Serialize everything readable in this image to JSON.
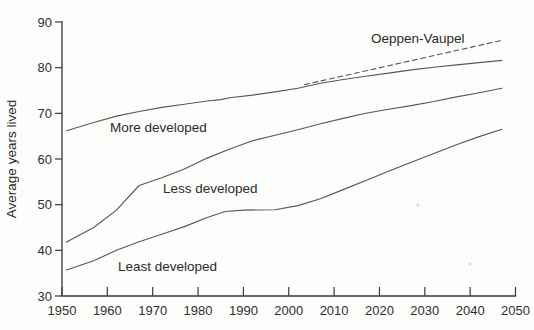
{
  "figure": {
    "kind": "scanned-book-line-chart",
    "background_color": "#fdfdfc",
    "line_color": "#585858",
    "axis_color": "#3a3a3a",
    "text_color": "#2b2b2b"
  },
  "chart_data": {
    "type": "line",
    "title": "",
    "xlabel": "",
    "ylabel": "Average years lived",
    "xlim": [
      1950,
      2050
    ],
    "ylim": [
      30,
      90
    ],
    "x_ticks": [
      1950,
      1960,
      1970,
      1980,
      1990,
      2000,
      2010,
      2020,
      2030,
      2040,
      2050
    ],
    "y_ticks": [
      30,
      40,
      50,
      60,
      70,
      80,
      90
    ],
    "grid": false,
    "legend_position": "inline-annotations",
    "series": [
      {
        "name": "More developed",
        "style": "solid",
        "points": [
          [
            1951,
            66.2
          ],
          [
            1957,
            68.0
          ],
          [
            1962,
            69.4
          ],
          [
            1967,
            70.4
          ],
          [
            1972,
            71.3
          ],
          [
            1977,
            72.0
          ],
          [
            1982,
            72.7
          ],
          [
            1985,
            73.0
          ],
          [
            1987,
            73.4
          ],
          [
            1992,
            74.0
          ],
          [
            1997,
            74.7
          ],
          [
            2002,
            75.5
          ],
          [
            2007,
            76.6
          ],
          [
            2012,
            77.4
          ],
          [
            2017,
            78.1
          ],
          [
            2022,
            78.8
          ],
          [
            2027,
            79.5
          ],
          [
            2032,
            80.1
          ],
          [
            2037,
            80.6
          ],
          [
            2042,
            81.1
          ],
          [
            2047,
            81.6
          ]
        ]
      },
      {
        "name": "Less developed",
        "style": "solid",
        "points": [
          [
            1951,
            41.8
          ],
          [
            1957,
            45.0
          ],
          [
            1962,
            48.8
          ],
          [
            1967,
            54.2
          ],
          [
            1972,
            55.9
          ],
          [
            1977,
            57.8
          ],
          [
            1982,
            60.2
          ],
          [
            1987,
            62.2
          ],
          [
            1992,
            64.0
          ],
          [
            1997,
            65.2
          ],
          [
            2002,
            66.4
          ],
          [
            2007,
            67.7
          ],
          [
            2012,
            68.9
          ],
          [
            2017,
            70.0
          ],
          [
            2022,
            70.9
          ],
          [
            2027,
            71.7
          ],
          [
            2032,
            72.6
          ],
          [
            2037,
            73.6
          ],
          [
            2042,
            74.5
          ],
          [
            2047,
            75.5
          ]
        ]
      },
      {
        "name": "Least developed",
        "style": "solid",
        "points": [
          [
            1951,
            35.7
          ],
          [
            1957,
            37.7
          ],
          [
            1962,
            40.0
          ],
          [
            1967,
            41.9
          ],
          [
            1972,
            43.5
          ],
          [
            1977,
            45.2
          ],
          [
            1982,
            47.2
          ],
          [
            1986,
            48.5
          ],
          [
            1990,
            48.8
          ],
          [
            1997,
            48.9
          ],
          [
            2002,
            49.8
          ],
          [
            2007,
            51.3
          ],
          [
            2012,
            53.3
          ],
          [
            2017,
            55.3
          ],
          [
            2022,
            57.3
          ],
          [
            2027,
            59.3
          ],
          [
            2032,
            61.2
          ],
          [
            2037,
            63.1
          ],
          [
            2042,
            64.9
          ],
          [
            2047,
            66.5
          ]
        ]
      },
      {
        "name": "Oeppen-Vaupel",
        "style": "dashed",
        "points": [
          [
            2003.5,
            76.3
          ],
          [
            2047,
            86.0
          ]
        ]
      }
    ],
    "annotations": [
      {
        "text": "More developed"
      },
      {
        "text": "Less developed"
      },
      {
        "text": "Least developed"
      },
      {
        "text": "Oeppen-Vaupel"
      }
    ]
  }
}
